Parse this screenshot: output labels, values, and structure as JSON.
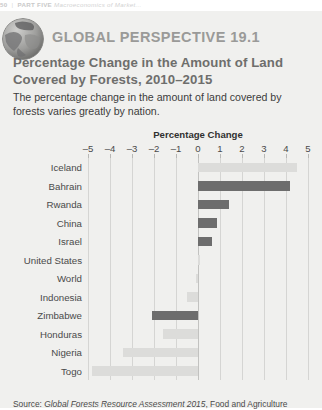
{
  "running_head": {
    "page_number": "50",
    "separator": "|",
    "part": "PART FIVE",
    "subtitle": "Macroeconomics of Market..."
  },
  "feature": {
    "globe_icon": "globe-icon",
    "label": "GLOBAL PERSPECTIVE 19.1",
    "title_line1": "Percentage Change in the Amount of Land",
    "title_line2": "Covered by Forests, 2010–2015",
    "description": "The percentage change in the amount of land covered by forests varies greatly by nation."
  },
  "colors": {
    "panel_background": "#f0f0ee",
    "bar_dark": "#6d6d6d",
    "bar_light": "#dcdcda",
    "gridline": "#d5d5d3",
    "heading": "#9a9a98",
    "title": "#6e6e6c"
  },
  "source": {
    "prefix": "Source:",
    "italic_title": "Global Forests Resource Assessment 2015",
    "trailing": ", Food and Agriculture"
  },
  "chart_data": {
    "type": "bar",
    "orientation": "horizontal",
    "title": "Percentage Change in the Amount of Land Covered by Forests, 2010–2015",
    "xlabel": "Percentage Change",
    "ylabel": "",
    "xlim": [
      -5,
      5
    ],
    "xticks": [
      -5,
      -4,
      -3,
      -2,
      -1,
      0,
      1,
      2,
      3,
      4,
      5
    ],
    "xtick_labels": [
      "–5",
      "–4",
      "–3",
      "–2",
      "–1",
      "0",
      "1",
      "2",
      "3",
      "4",
      "5"
    ],
    "grid": true,
    "legend": "none",
    "categories": [
      "Iceland",
      "Bahrain",
      "Rwanda",
      "China",
      "Israel",
      "United States",
      "World",
      "Indonesia",
      "Zimbabwe",
      "Honduras",
      "Nigeria",
      "Togo"
    ],
    "values": [
      4.5,
      4.2,
      1.4,
      0.85,
      0.65,
      0.1,
      -0.1,
      -0.5,
      -2.1,
      -1.6,
      -3.4,
      -4.8
    ],
    "bar_shades": [
      "light",
      "dark",
      "dark",
      "dark",
      "dark",
      "light",
      "light",
      "light",
      "dark",
      "light",
      "light",
      "light"
    ]
  }
}
